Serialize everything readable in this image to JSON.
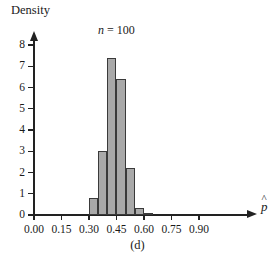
{
  "chart_data": {
    "type": "bar",
    "title": "",
    "subtitle": "",
    "annotation": "n = 100",
    "annotation_symbol": "n",
    "annotation_value": "= 100",
    "caption": "(d)",
    "xlabel": "p̂",
    "ylabel": "Density",
    "xlim": [
      0.0,
      0.95
    ],
    "ylim": [
      0,
      8
    ],
    "grid": false,
    "legend": "none",
    "bin_width": 0.05,
    "bin_edges": [
      0.3,
      0.35,
      0.4,
      0.45,
      0.5,
      0.55,
      0.6,
      0.65
    ],
    "categories": [
      "0.30-0.35",
      "0.35-0.40",
      "0.40-0.45",
      "0.45-0.50",
      "0.50-0.55",
      "0.55-0.60",
      "0.60-0.65"
    ],
    "values": [
      0.8,
      3.0,
      7.4,
      6.4,
      2.2,
      0.35,
      0.1
    ],
    "bars": [
      {
        "x0": 0.3,
        "x1": 0.35,
        "density": 0.8
      },
      {
        "x0": 0.35,
        "x1": 0.4,
        "density": 3.0
      },
      {
        "x0": 0.4,
        "x1": 0.45,
        "density": 7.4
      },
      {
        "x0": 0.45,
        "x1": 0.5,
        "density": 6.4
      },
      {
        "x0": 0.5,
        "x1": 0.55,
        "density": 2.2
      },
      {
        "x0": 0.55,
        "x1": 0.6,
        "density": 0.35
      },
      {
        "x0": 0.6,
        "x1": 0.65,
        "density": 0.1
      }
    ],
    "x_ticks": [
      {
        "value": 0.0,
        "label": "0.00"
      },
      {
        "value": 0.15,
        "label": "0.15"
      },
      {
        "value": 0.3,
        "label": "0.30"
      },
      {
        "value": 0.45,
        "label": "0.45"
      },
      {
        "value": 0.6,
        "label": "0.60"
      },
      {
        "value": 0.75,
        "label": "0.75"
      },
      {
        "value": 0.9,
        "label": "0.90"
      }
    ],
    "y_ticks": [
      {
        "value": 0,
        "label": "0"
      },
      {
        "value": 1,
        "label": "1"
      },
      {
        "value": 2,
        "label": "2"
      },
      {
        "value": 3,
        "label": "3"
      },
      {
        "value": 4,
        "label": "4"
      },
      {
        "value": 5,
        "label": "5"
      },
      {
        "value": 6,
        "label": "6"
      },
      {
        "value": 7,
        "label": "7"
      },
      {
        "value": 8,
        "label": "8"
      }
    ],
    "colors": {
      "bar_fill": "#a9a9a9",
      "bar_stroke": "#3a3a3a",
      "axis": "#222222",
      "text": "#1a1a1a",
      "background": "#ffffff"
    }
  }
}
